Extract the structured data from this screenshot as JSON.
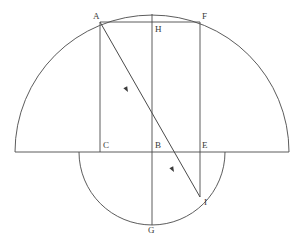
{
  "figure": {
    "background_color": "#ffffff",
    "stroke_color": "#4a4a4a",
    "label_color": "#3a3a3a",
    "stroke_width": 0.9,
    "width": 301,
    "height": 240
  },
  "labels": [
    {
      "id": "A",
      "text": "A",
      "x": 93,
      "y": 12
    },
    {
      "id": "H",
      "text": "H",
      "x": 155,
      "y": 25
    },
    {
      "id": "F",
      "text": "F",
      "x": 202,
      "y": 12
    },
    {
      "id": "C",
      "text": "C",
      "x": 103,
      "y": 141
    },
    {
      "id": "B",
      "text": "B",
      "x": 155,
      "y": 141
    },
    {
      "id": "E",
      "text": "E",
      "x": 202,
      "y": 141
    },
    {
      "id": "I",
      "text": "I",
      "x": 204,
      "y": 198
    },
    {
      "id": "G",
      "text": "G",
      "x": 148,
      "y": 226
    }
  ],
  "points": {
    "A": {
      "x": 100,
      "y": 22
    },
    "H": {
      "x": 152,
      "y": 22
    },
    "F": {
      "x": 200,
      "y": 22
    },
    "C": {
      "x": 100,
      "y": 152
    },
    "B": {
      "x": 152,
      "y": 152
    },
    "E": {
      "x": 200,
      "y": 152
    },
    "I": {
      "x": 200,
      "y": 197
    },
    "G": {
      "x": 152,
      "y": 225
    },
    "left_end": {
      "x": 15,
      "y": 152
    },
    "right_end": {
      "x": 289,
      "y": 152
    },
    "arc_apex": {
      "x": 152,
      "y": 14
    }
  },
  "shapes": {
    "outer_semicircle": {
      "name": "outer-semicircle",
      "center_x": 152,
      "center_y": 152,
      "radius": 137,
      "half": "upper",
      "path": "M 15 152 A 137 137 0 0 1 289 152"
    },
    "inner_semicircle": {
      "name": "inner-semicircle",
      "center_x": 152,
      "center_y": 152,
      "radius": 73,
      "half": "lower",
      "path": "M 79 152 A 73 73 0 0 0 225 152"
    },
    "diameter_line": {
      "name": "horizontal-diameter",
      "path": "M 15 152 L 289 152"
    },
    "vertical_axis": {
      "name": "vertical-axis-HG",
      "path": "M 152 14 L 152 225"
    },
    "chord_AF": {
      "name": "chord-AF",
      "path": "M 100 22 L 200 22"
    },
    "segment_AC": {
      "name": "segment-AC",
      "path": "M 100 22 L 100 152"
    },
    "segment_FI": {
      "name": "segment-FEI",
      "path": "M 200 22 L 200 197"
    },
    "ray_AI": {
      "name": "ray-AI",
      "path": "M 100 22 L 200 197"
    }
  },
  "arrow_markers": [
    {
      "id": "arrow-1",
      "on": "ray-AI",
      "x": 128,
      "y": 92,
      "angle_deg": 60.3
    },
    {
      "id": "arrow-2",
      "on": "ray-AI",
      "x": 174,
      "y": 172,
      "angle_deg": 60.3
    }
  ],
  "icons": {
    "arrowhead": "arrowhead-icon"
  }
}
